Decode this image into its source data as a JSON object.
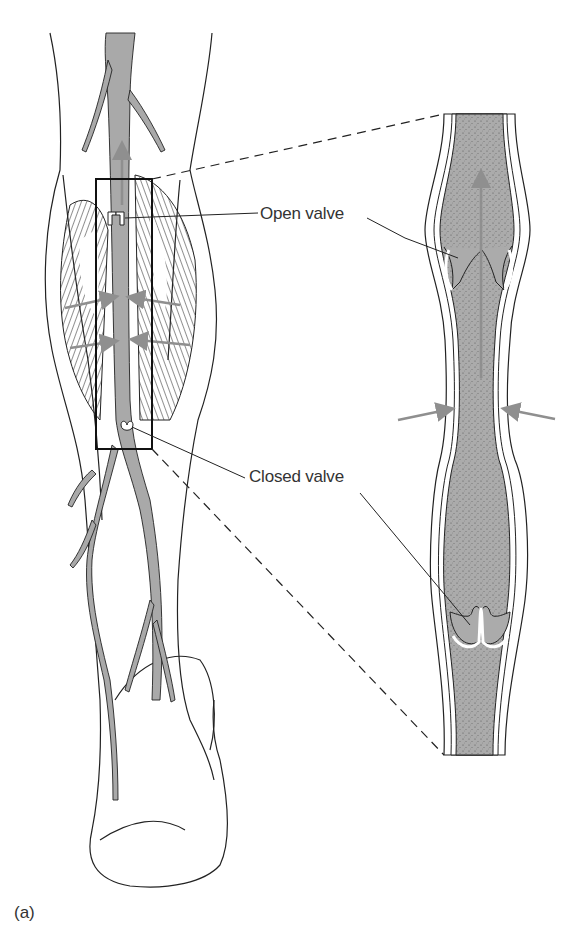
{
  "figure": {
    "panel_label": "(a)",
    "labels": {
      "open_valve": "Open valve",
      "closed_valve": "Closed valve"
    },
    "colors": {
      "vein_fill": "#a9a9a9",
      "vein_stipple": "#6e6e6e",
      "outline": "#222222",
      "arrow": "#8f8f8f",
      "background": "#ffffff"
    }
  }
}
